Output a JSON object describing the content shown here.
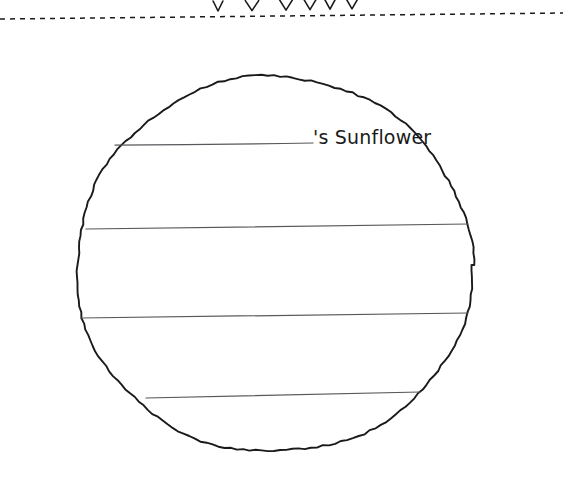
{
  "page": {
    "kind": "printable-coloring-worksheet",
    "background_color": "#ffffff",
    "ink_color": "#1a1a1a",
    "width": 563,
    "height": 492
  },
  "cut_line": {
    "label": "dashed-cut-line",
    "style": "dashed",
    "y_left": 19,
    "y_right": 14
  },
  "above_tips": {
    "label": "petal-tips-from-flower-above",
    "count": 6
  },
  "title": {
    "possessive_suffix": "'s Sunflower",
    "name_blank_line": {
      "x1": 115,
      "x2": 313,
      "y": 145
    }
  },
  "writing_lines": [
    {
      "id": "line-1",
      "x1": 115,
      "y1": 145,
      "x2": 313,
      "y2": 143
    },
    {
      "id": "line-2",
      "x1": 86,
      "y1": 229,
      "x2": 468,
      "y2": 224
    },
    {
      "id": "line-3",
      "x1": 81,
      "y1": 318,
      "x2": 468,
      "y2": 313
    },
    {
      "id": "line-4",
      "x1": 146,
      "y1": 398,
      "x2": 420,
      "y2": 392
    }
  ],
  "flower": {
    "center": {
      "cx": 274,
      "cy": 265
    },
    "disc_radius_x": 198,
    "disc_radius_y": 188,
    "inner_petal_count": 30,
    "outer_petal_count": 30,
    "petal_shape": "pointed-leaf",
    "petal_hatching": "short-comb-strokes-at-base"
  },
  "colors": {
    "ink": "#1a1a1a",
    "line": "#55585c",
    "paper": "#ffffff"
  }
}
